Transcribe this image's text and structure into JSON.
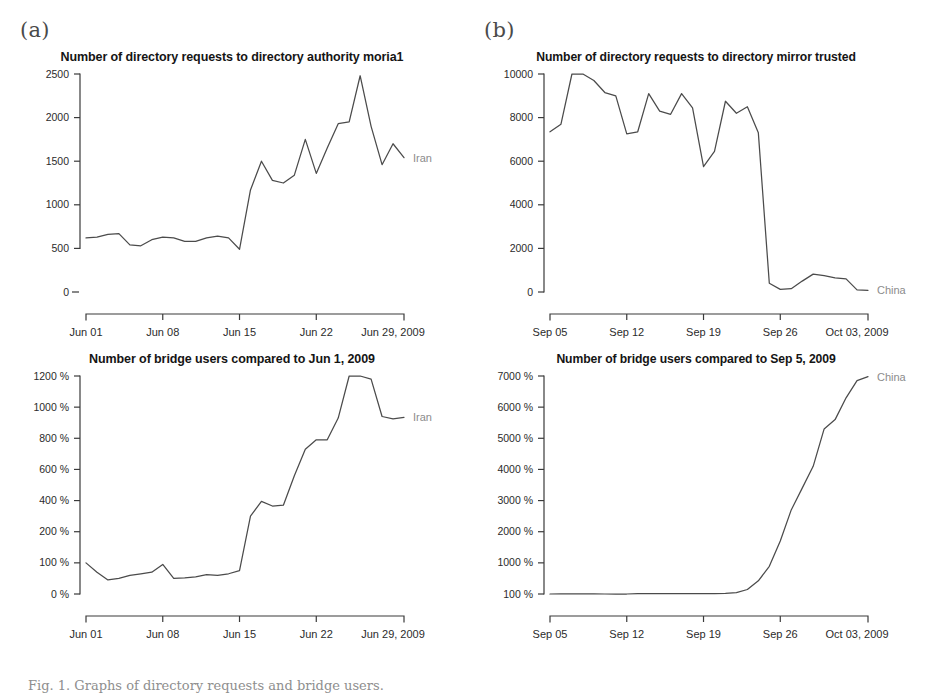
{
  "figure": {
    "panels": [
      {
        "id": "a",
        "label": "(a)"
      },
      {
        "id": "b",
        "label": "(b)"
      }
    ],
    "caption": "Fig. 1. Graphs of directory requests and bridge users."
  },
  "chart_data": [
    {
      "id": "a-top",
      "type": "line",
      "title": "Number of directory requests to directory authority moria1",
      "xlabel": "",
      "ylabel": "",
      "series_label": "Iran",
      "grid": false,
      "legend_position": "right-inline",
      "xticks": [
        "Jun 01",
        "Jun 08",
        "Jun 15",
        "Jun 22",
        "Jun 29, 2009"
      ],
      "xtick_values": [
        1,
        8,
        15,
        22,
        29
      ],
      "yticks": [
        0,
        500,
        1000,
        1500,
        2000,
        2500
      ],
      "ytick_labels": [
        "0",
        "500",
        "1000",
        "1500",
        "2000",
        "2500"
      ],
      "axis_break_below": 500,
      "xlim": [
        1,
        30
      ],
      "ylim": [
        500,
        2500
      ],
      "x": [
        1,
        2,
        3,
        4,
        5,
        6,
        7,
        8,
        9,
        10,
        11,
        12,
        13,
        14,
        15,
        16,
        17,
        18,
        19,
        20,
        21,
        22,
        23,
        24,
        25,
        26,
        27,
        28,
        29,
        30
      ],
      "values": [
        620,
        630,
        660,
        670,
        540,
        530,
        600,
        630,
        620,
        580,
        580,
        620,
        640,
        620,
        490,
        1170,
        1500,
        1280,
        1250,
        1340,
        1750,
        1360,
        1650,
        1930,
        1950,
        2480,
        1900,
        1460,
        1700,
        1540
      ]
    },
    {
      "id": "a-bottom",
      "type": "line",
      "title": "Number of bridge users compared to Jun 1, 2009",
      "xlabel": "",
      "ylabel": "",
      "series_label": "Iran",
      "grid": false,
      "legend_position": "right-inline",
      "xticks": [
        "Jun 01",
        "Jun 08",
        "Jun 15",
        "Jun 22",
        "Jun 29, 2009"
      ],
      "xtick_values": [
        1,
        8,
        15,
        22,
        29
      ],
      "yticks": [
        0,
        100,
        200,
        400,
        600,
        800,
        1000,
        1200
      ],
      "ytick_labels": [
        "0 %",
        "100 %",
        "200 %",
        "400 %",
        "600 %",
        "800 %",
        "1000 %",
        "1200 %"
      ],
      "xlim": [
        1,
        30
      ],
      "ylim": [
        0,
        1300
      ],
      "x": [
        1,
        2,
        3,
        4,
        5,
        6,
        7,
        8,
        9,
        10,
        11,
        12,
        13,
        14,
        15,
        16,
        17,
        18,
        19,
        20,
        21,
        22,
        23,
        24,
        25,
        26,
        27,
        28,
        29,
        30
      ],
      "values": [
        100,
        70,
        45,
        50,
        60,
        65,
        70,
        95,
        50,
        52,
        55,
        62,
        60,
        65,
        75,
        300,
        395,
        365,
        370,
        560,
        730,
        790,
        790,
        930,
        1230,
        1270,
        1180,
        940,
        925,
        935
      ]
    },
    {
      "id": "b-top",
      "type": "line",
      "title": "Number of directory requests to directory mirror trusted",
      "xlabel": "",
      "ylabel": "",
      "series_label": "China",
      "grid": false,
      "legend_position": "right-inline",
      "xticks": [
        "Sep 05",
        "Sep 12",
        "Sep 19",
        "Sep 26",
        "Oct 03, 2009"
      ],
      "xtick_values": [
        5,
        12,
        19,
        26,
        33
      ],
      "yticks": [
        0,
        2000,
        4000,
        6000,
        8000,
        10000
      ],
      "ytick_labels": [
        "0",
        "2000",
        "4000",
        "6000",
        "8000",
        "10000"
      ],
      "xlim": [
        5,
        34
      ],
      "ylim": [
        0,
        11300
      ],
      "x": [
        5,
        6,
        7,
        8,
        9,
        10,
        11,
        12,
        13,
        14,
        15,
        16,
        17,
        18,
        19,
        20,
        21,
        22,
        23,
        24,
        25,
        26,
        27,
        28,
        29,
        30,
        31,
        32,
        33,
        34
      ],
      "values": [
        7350,
        7700,
        11100,
        10500,
        9700,
        9150,
        9000,
        7250,
        7350,
        9100,
        8300,
        8150,
        9100,
        8450,
        5750,
        6450,
        8750,
        8200,
        8500,
        7300,
        400,
        120,
        150,
        500,
        820,
        750,
        650,
        600,
        100,
        80
      ]
    },
    {
      "id": "b-bottom",
      "type": "line",
      "title": "Number of bridge users compared to Sep 5, 2009",
      "xlabel": "",
      "ylabel": "",
      "series_label": "China",
      "grid": false,
      "legend_position": "right-inline",
      "xticks": [
        "Sep 05",
        "Sep 12",
        "Sep 19",
        "Sep 26",
        "Oct 03, 2009"
      ],
      "xtick_values": [
        5,
        12,
        19,
        26,
        33
      ],
      "yticks": [
        100,
        1000,
        2000,
        3000,
        4000,
        5000,
        6000,
        7000
      ],
      "ytick_labels": [
        "100 %",
        "1000 %",
        "2000 %",
        "3000 %",
        "4000 %",
        "5000 %",
        "6000 %",
        "7000 %"
      ],
      "xlim": [
        5,
        34
      ],
      "ylim": [
        100,
        7000
      ],
      "x": [
        5,
        6,
        7,
        8,
        9,
        10,
        11,
        12,
        13,
        14,
        15,
        16,
        17,
        18,
        19,
        20,
        21,
        22,
        23,
        24,
        25,
        26,
        27,
        28,
        29,
        30,
        31,
        32,
        33,
        34
      ],
      "values": [
        100,
        105,
        105,
        105,
        105,
        100,
        100,
        100,
        110,
        112,
        112,
        110,
        110,
        110,
        108,
        110,
        115,
        140,
        230,
        480,
        900,
        1700,
        2700,
        3400,
        4100,
        5300,
        5600,
        6300,
        6850,
        6980
      ]
    }
  ]
}
